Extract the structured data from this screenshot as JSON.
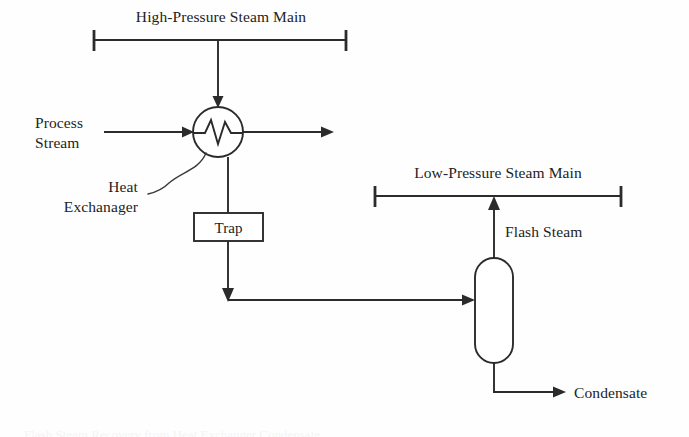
{
  "figure": {
    "type": "process-flow-diagram",
    "title": "Flash Steam Recovery from Heat Exchanger Condensate",
    "background_color": "#fefefe",
    "line_color": "#2b2b2b",
    "text_color": "#232323"
  },
  "labels": {
    "hp_steam_main": "High-Pressure Steam Main",
    "lp_steam_main": "Low-Pressure Steam Main",
    "process_stream_line1": "Process",
    "process_stream_line2": "Stream",
    "heat_exchanger_line1": "Heat",
    "heat_exchanger_line2": "Exchanager",
    "trap": "Trap",
    "flash_steam": "Flash Steam",
    "condensate": "Condensate"
  },
  "equipment": [
    {
      "id": "heat-exchanger",
      "label": "Heat Exchanager",
      "shape": "circle-with-zigzag",
      "cx": 218,
      "cy": 132,
      "r": 25
    },
    {
      "id": "steam-trap",
      "label": "Trap",
      "shape": "rectangle",
      "x": 194,
      "y": 213,
      "width": 69,
      "height": 28
    },
    {
      "id": "flash-vessel",
      "label": "",
      "shape": "stadium-vertical",
      "x": 475,
      "y": 258,
      "width": 38,
      "height": 105
    }
  ],
  "headers": [
    {
      "id": "hp-main",
      "label": "High-Pressure Steam Main",
      "y": 40,
      "x_start": 93,
      "x_end": 347
    },
    {
      "id": "lp-main",
      "label": "Low-Pressure Steam Main",
      "y": 196,
      "x_start": 374,
      "x_end": 622
    }
  ],
  "streams": [
    {
      "id": "hp-steam-drop",
      "from": "High-Pressure Steam Main",
      "to": "Heat Exchanager",
      "direction": "down",
      "arrow": true
    },
    {
      "id": "process-in",
      "from": "Process Stream",
      "to": "Heat Exchanager",
      "direction": "right",
      "arrow": true
    },
    {
      "id": "process-out",
      "from": "Heat Exchanager",
      "to": "",
      "direction": "right",
      "arrow": true
    },
    {
      "id": "condensate-to-trap",
      "from": "Heat Exchanager",
      "to": "Trap",
      "direction": "down",
      "arrow": false
    },
    {
      "id": "trap-outlet",
      "from": "Trap",
      "to": "Flash Vessel",
      "direction": "down-then-right",
      "arrow": true
    },
    {
      "id": "flash-steam-riser",
      "from": "Flash Vessel",
      "to": "Low-Pressure Steam Main",
      "direction": "up",
      "arrow": true
    },
    {
      "id": "condensate-out",
      "from": "Flash Vessel",
      "to": "Condensate",
      "direction": "down-then-right",
      "arrow": true
    }
  ]
}
